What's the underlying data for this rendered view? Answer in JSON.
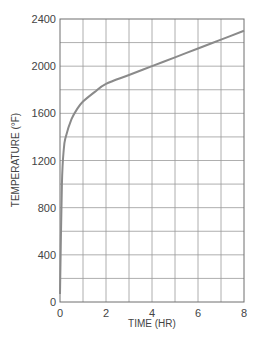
{
  "chart_data": {
    "type": "line",
    "title": "",
    "xlabel": "TIME (HR)",
    "ylabel": "TEMPERATURE (°F)",
    "xlim": [
      0,
      8
    ],
    "ylim": [
      0,
      2400
    ],
    "x_ticks": [
      0,
      2,
      4,
      6,
      8
    ],
    "y_ticks": [
      0,
      400,
      800,
      1200,
      1600,
      2000,
      2400
    ],
    "x_tick_labels": [
      "0",
      "2",
      "4",
      "6",
      "8"
    ],
    "y_tick_labels": [
      "0",
      "400",
      "800",
      "1200",
      "1600",
      "2000",
      "2400"
    ],
    "grid": true,
    "grid_x_step": 1,
    "grid_y_step": 200,
    "legend": null,
    "series": [
      {
        "name": "Temperature",
        "color": "#8a8a8a",
        "x": [
          0,
          0.0833,
          0.1667,
          0.25,
          0.5,
          0.75,
          1,
          1.5,
          2,
          3,
          4,
          5,
          6,
          7,
          8
        ],
        "y": [
          68,
          1000,
          1300,
          1400,
          1550,
          1638,
          1700,
          1780,
          1850,
          1925,
          2000,
          2075,
          2150,
          2225,
          2300
        ]
      }
    ]
  },
  "colors": {
    "grid": "#9a9a9a",
    "frame": "#6e6e6e",
    "text": "#444444"
  }
}
